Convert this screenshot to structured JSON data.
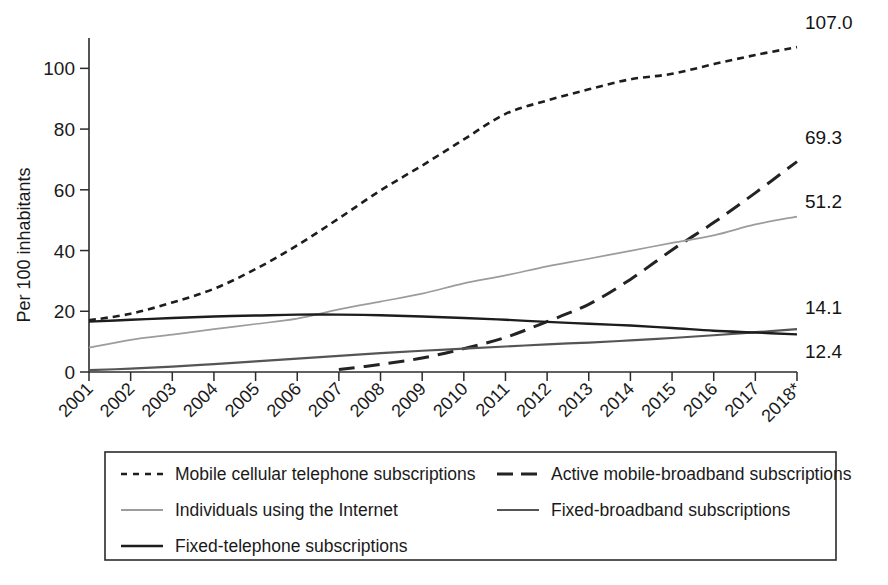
{
  "chart_data": {
    "type": "line",
    "title": "",
    "subtitle": "",
    "xlabel": "",
    "ylabel": "Per 100 inhabitants",
    "x": [
      "2001",
      "2002",
      "2003",
      "2004",
      "2005",
      "2006",
      "2007",
      "2008",
      "2009",
      "2010",
      "2011",
      "2012",
      "2013",
      "2014",
      "2015",
      "2016",
      "2017",
      "2018*"
    ],
    "xlim": [
      2001,
      2018
    ],
    "ylim": [
      0,
      110
    ],
    "yticks": [
      0,
      20,
      40,
      60,
      80,
      100
    ],
    "ytick_labels": [
      "0",
      "20",
      "40",
      "60",
      "80",
      "100"
    ],
    "grid": false,
    "legend_position": "bottom",
    "series": [
      {
        "name": "Mobile cellular telephone subscriptions",
        "style": "short-dash",
        "color": "#1d1d1d",
        "width": 2.6,
        "dasharray": "7,5",
        "end_label": "107.0",
        "values": [
          17.0,
          19.2,
          22.9,
          27.4,
          33.9,
          41.7,
          50.6,
          59.8,
          68.0,
          76.6,
          85.0,
          89.4,
          93.1,
          96.4,
          98.2,
          101.4,
          104.4,
          107.0
        ]
      },
      {
        "name": "Active mobile-broadband subscriptions",
        "style": "long-dash",
        "color": "#232323",
        "width": 3.0,
        "dasharray": "16,9",
        "end_label": "69.3",
        "values": [
          null,
          null,
          null,
          null,
          null,
          null,
          0.8,
          2.5,
          4.6,
          7.7,
          11.4,
          16.6,
          22.3,
          30.5,
          40.2,
          49.2,
          59.0,
          69.3
        ]
      },
      {
        "name": "Individuals using the Internet",
        "style": "solid-light",
        "color": "#9c9c9c",
        "width": 1.7,
        "dasharray": "",
        "end_label": "51.2",
        "values": [
          8.0,
          10.6,
          12.3,
          14.1,
          15.8,
          17.6,
          20.6,
          23.2,
          25.8,
          29.2,
          31.8,
          34.8,
          37.3,
          39.9,
          42.5,
          45.0,
          48.6,
          51.2
        ]
      },
      {
        "name": "Fixed-broadband subscriptions",
        "style": "solid-mid",
        "color": "#555555",
        "width": 2.2,
        "end_label": "14.1",
        "dasharray": "",
        "values": [
          0.6,
          1.1,
          1.8,
          2.6,
          3.5,
          4.4,
          5.3,
          6.2,
          7.0,
          7.7,
          8.4,
          9.1,
          9.7,
          10.4,
          11.2,
          12.1,
          13.1,
          14.1
        ]
      },
      {
        "name": "Fixed-telephone subscriptions",
        "style": "solid-dark",
        "color": "#1d1d1d",
        "width": 2.4,
        "dasharray": "",
        "end_label": "12.4",
        "values": [
          16.6,
          17.2,
          17.8,
          18.3,
          18.6,
          18.9,
          18.9,
          18.7,
          18.3,
          17.8,
          17.2,
          16.5,
          15.9,
          15.3,
          14.5,
          13.6,
          13.0,
          12.4
        ]
      }
    ],
    "end_labels": [
      "107.0",
      "69.3",
      "51.2",
      "14.1",
      "12.4"
    ],
    "legend_entries": [
      {
        "label": "Mobile cellular telephone subscriptions",
        "style": "short-dash",
        "color": "#1d1d1d"
      },
      {
        "label": "Active mobile-broadband subscriptions",
        "style": "long-dash",
        "color": "#232323"
      },
      {
        "label": "Individuals using the Internet",
        "style": "solid-light",
        "color": "#9c9c9c"
      },
      {
        "label": "Fixed-broadband subscriptions",
        "style": "solid-mid",
        "color": "#555555"
      },
      {
        "label": "Fixed-telephone subscriptions",
        "style": "solid-dark",
        "color": "#1d1d1d"
      }
    ]
  }
}
